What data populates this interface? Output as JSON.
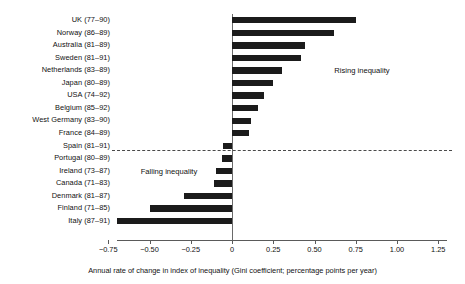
{
  "chart_data": {
    "type": "bar",
    "orientation": "horizontal",
    "title": "",
    "xlabel": "Annual rate of change in index of inequality (Gini coefficient; percentage points per year)",
    "ylabel": "",
    "xlim": [
      -0.75,
      1.25
    ],
    "xticks": [
      -0.75,
      -0.5,
      -0.25,
      0,
      0.25,
      0.5,
      0.75,
      1.0,
      1.25
    ],
    "xticklabels": [
      "−0.75",
      "−0.50",
      "−0.25",
      "0",
      "0.25",
      "0.50",
      "0.75",
      "1.00",
      "1.25"
    ],
    "grid": false,
    "legend": null,
    "bar_color": "#1b1b1b",
    "categories": [
      "UK (77–90)",
      "Norway (86–89)",
      "Australia (81–89)",
      "Sweden (81–91)",
      "Netherlands (83–89)",
      "Japan (80–89)",
      "USA (74–92)",
      "Belgium (85–92)",
      "West Germany (83–90)",
      "France (84–89)",
      "Spain (81–91)",
      "Portugal (80–89)",
      "Ireland (73–87)",
      "Canada (71–83)",
      "Denmark (81–87)",
      "Finland (71–85)",
      "Italy (87–91)"
    ],
    "values": [
      0.75,
      0.62,
      0.44,
      0.42,
      0.3,
      0.25,
      0.195,
      0.155,
      0.115,
      0.1,
      -0.055,
      -0.06,
      -0.095,
      -0.11,
      -0.29,
      -0.5,
      -0.7
    ],
    "annotations": [
      {
        "text": "Rising inequality",
        "x": 0.62,
        "y": "row-5"
      },
      {
        "text": "Falling inequality",
        "x": -0.42,
        "y": "row-13"
      }
    ],
    "reference_line": {
      "style": "dashed",
      "between": [
        "France (84–89)",
        "Spain (81–91)"
      ]
    }
  }
}
